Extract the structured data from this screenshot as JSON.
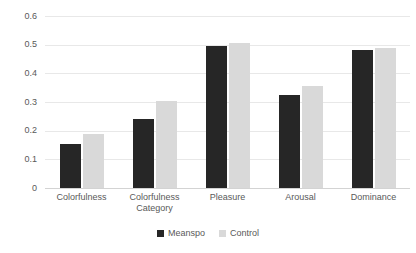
{
  "chart_data": {
    "type": "bar",
    "title": "",
    "xlabel": "",
    "ylabel": "",
    "categories": [
      "Colorfulness",
      "Colorfulness\nCategory",
      "Pleasure",
      "Arousal",
      "Dominance"
    ],
    "series": [
      {
        "name": "Meanspo",
        "color": "#262626",
        "values": [
          0.155,
          0.24,
          0.495,
          0.325,
          0.48
        ]
      },
      {
        "name": "Control",
        "color": "#d9d9d9",
        "values": [
          0.19,
          0.305,
          0.505,
          0.355,
          0.49
        ]
      }
    ],
    "ylim": [
      0,
      0.6
    ],
    "yticks": [
      0,
      0.1,
      0.2,
      0.3,
      0.4,
      0.5,
      0.6
    ],
    "ytick_labels": [
      "0",
      "0.1",
      "0.2",
      "0.3",
      "0.4",
      "0.5",
      "0.6"
    ],
    "grid": true,
    "grid_axis": "y",
    "legend_position": "bottom",
    "background": "#ffffff",
    "gridline_color": "#e8e8e8",
    "text_color": "#595959"
  }
}
